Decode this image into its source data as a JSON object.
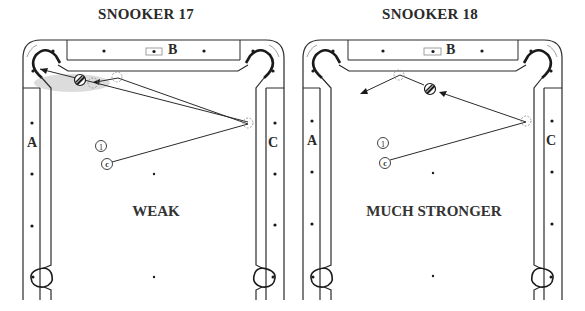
{
  "figure": {
    "panels": [
      {
        "id": "snooker-17",
        "title": "SNOOKER 17",
        "verdict": "WEAK",
        "rail_labels": {
          "left": "A",
          "top": "B",
          "right": "C"
        },
        "markers": {
          "object_ball": "1",
          "cue_ball": "c"
        },
        "shot": "cue ball driven up to the right cushion, rebounding toward the top-left pocket area and nudging behind the striped ball near the pocket"
      },
      {
        "id": "snooker-18",
        "title": "SNOOKER 18",
        "verdict": "MUCH STRONGER",
        "rail_labels": {
          "left": "A",
          "top": "B",
          "right": "C"
        },
        "markers": {
          "object_ball": "1",
          "cue_ball": "c"
        },
        "shot": "cue ball off the right cushion, strikes the striped ball, glances off the top cushion and heads to the left"
      }
    ],
    "colors": {
      "line": "#2b2b2b",
      "shading": "#d9d9d9",
      "background": "#ffffff"
    }
  }
}
